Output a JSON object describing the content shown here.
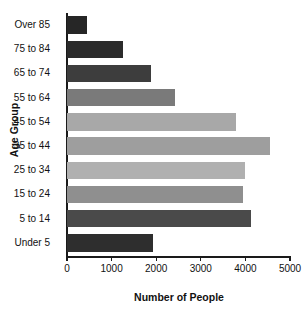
{
  "chart_data": {
    "type": "bar",
    "orientation": "horizontal",
    "title": "",
    "xlabel": "Number of People",
    "ylabel": "Age Group",
    "categories": [
      "Over 85",
      "75 to 84",
      "65 to 74",
      "55 to 64",
      "45 to 54",
      "35 to 44",
      "25 to 34",
      "15 to 24",
      "5 to 14",
      "Under 5"
    ],
    "values": [
      450,
      1250,
      1880,
      2430,
      3780,
      4550,
      4000,
      3950,
      4120,
      1930
    ],
    "bar_colors": [
      "#262626",
      "#2b2b2b",
      "#3d3d3d",
      "#7a7a7a",
      "#a8a8a8",
      "#9e9e9e",
      "#b0b0b0",
      "#8f8f8f",
      "#4a4a4a",
      "#2e2e2e"
    ],
    "xlim": [
      0,
      5000
    ],
    "xticks": [
      0,
      1000,
      2000,
      3000,
      4000,
      5000
    ],
    "xtick_labels": [
      "0",
      "1000",
      "2000",
      "3000",
      "4000",
      "5000"
    ],
    "grid": false,
    "legend": false
  }
}
